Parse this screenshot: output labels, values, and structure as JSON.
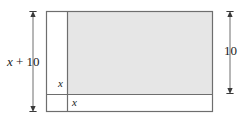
{
  "figure": {
    "background_color": "#ffffff",
    "shaded_fill_color": "#e6e6e6",
    "line_color": "#6e6e6e",
    "text_color": "#1a1a1a"
  },
  "labels": {
    "left_dimension": "x + 10",
    "left_dimension_var": "x",
    "left_dimension_rest": " + 10",
    "right_dimension": "10",
    "inner_vertical_strip": "x",
    "inner_horizontal_strip": "x"
  },
  "shapes": {
    "outer_rectangle": {
      "name": "outer-rectangle",
      "x": 46,
      "y": 11,
      "width": 167,
      "height": 101
    },
    "shaded_rectangle": {
      "name": "shaded-rectangle",
      "x": 67,
      "y": 11,
      "width": 146,
      "height": 83
    },
    "vertical_divider": {
      "name": "vertical-divider-line",
      "x": 67,
      "y1": 11,
      "y2": 112
    },
    "horizontal_divider": {
      "name": "horizontal-divider-line",
      "x1": 46,
      "x2": 213,
      "y": 94
    }
  },
  "dimension_arrows": {
    "left": {
      "name": "left-dimension-arrow",
      "x": 33,
      "y_top": 11,
      "y_bottom": 112
    },
    "right": {
      "name": "right-dimension-arrow",
      "x": 230,
      "y_top": 11,
      "y_bottom": 94
    }
  }
}
